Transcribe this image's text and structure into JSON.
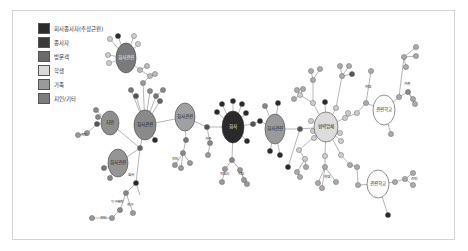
{
  "legend": [
    {
      "label": "회사종사자(추정근원)",
      "color": "#2b2b2b"
    },
    {
      "label": "종사자",
      "color": "#3a3a3a"
    },
    {
      "label": "방문객",
      "color": "#6b6b6b"
    },
    {
      "label": "학생",
      "color": "#d9d9d9"
    },
    {
      "label": "가족",
      "color": "#9a9a9a"
    },
    {
      "label": "지인/기타",
      "color": "#7d7d7d"
    }
  ],
  "hubs": [
    {
      "id": "h1",
      "label": "회사관련",
      "x": 126,
      "y": 58,
      "rx": 10,
      "ry": 15,
      "fill": "#7a7a7a",
      "light": true
    },
    {
      "id": "h2",
      "label": "지인",
      "x": 110,
      "y": 123,
      "rx": 9,
      "ry": 12,
      "fill": "#8f8f8f",
      "light": false
    },
    {
      "id": "h3",
      "label": "회사관련",
      "x": 145,
      "y": 125,
      "rx": 11,
      "ry": 15,
      "fill": "#8a8a8a",
      "light": false
    },
    {
      "id": "h4",
      "label": "회사관련",
      "x": 118,
      "y": 163,
      "rx": 10,
      "ry": 14,
      "fill": "#959595",
      "light": false
    },
    {
      "id": "h5",
      "label": "회사관련",
      "x": 185,
      "y": 117,
      "rx": 10,
      "ry": 14,
      "fill": "#a0a0a0",
      "light": false
    },
    {
      "id": "h6",
      "label": "회사",
      "x": 233,
      "y": 127,
      "rx": 11,
      "ry": 16,
      "fill": "#2a2a2a",
      "light": true
    },
    {
      "id": "h7",
      "label": "회사관련",
      "x": 275,
      "y": 129,
      "rx": 10,
      "ry": 15,
      "fill": "#9a9a9a",
      "light": false
    },
    {
      "id": "h8",
      "label": "협력업체",
      "x": 326,
      "y": 127,
      "rx": 12,
      "ry": 15,
      "fill": "#dcdcdc",
      "light": false
    },
    {
      "id": "h9",
      "label": "관련학교",
      "x": 384,
      "y": 110,
      "rx": 11,
      "ry": 15,
      "fill": "#ffffff",
      "light": false
    },
    {
      "id": "h10",
      "label": "관련학교",
      "x": 378,
      "y": 184,
      "rx": 11,
      "ry": 14,
      "fill": "#ffffff",
      "light": false
    }
  ],
  "edge_labels": [
    {
      "text": "지인",
      "x": 84,
      "y": 136
    },
    {
      "text": "회사",
      "x": 131,
      "y": 176
    },
    {
      "text": "누구관련",
      "x": 117,
      "y": 203
    },
    {
      "text": "친구",
      "x": 130,
      "y": 206
    },
    {
      "text": "지인",
      "x": 103,
      "y": 219
    },
    {
      "text": "지인",
      "x": 175,
      "y": 160
    },
    {
      "text": "가족",
      "x": 208,
      "y": 140
    },
    {
      "text": "학원시",
      "x": 224,
      "y": 175
    },
    {
      "text": "지인",
      "x": 241,
      "y": 175
    },
    {
      "text": "학원",
      "x": 368,
      "y": 88
    },
    {
      "text": "가족",
      "x": 407,
      "y": 85
    },
    {
      "text": "학원",
      "x": 327,
      "y": 178
    },
    {
      "text": "지인",
      "x": 414,
      "y": 180
    }
  ],
  "small_nodes": [
    {
      "x": 118,
      "y": 36,
      "c": "#2a2a2a"
    },
    {
      "x": 110,
      "y": 39,
      "c": "#ccc"
    },
    {
      "x": 134,
      "y": 36,
      "c": "#ccc"
    },
    {
      "x": 138,
      "y": 44,
      "c": "#ccc"
    },
    {
      "x": 108,
      "y": 55,
      "c": "#ccc"
    },
    {
      "x": 109,
      "y": 63,
      "c": "#ccc"
    },
    {
      "x": 140,
      "y": 70,
      "c": "#bbb"
    },
    {
      "x": 147,
      "y": 66,
      "c": "#bbb"
    },
    {
      "x": 150,
      "y": 76,
      "c": "#bbb"
    },
    {
      "x": 155,
      "y": 74,
      "c": "#bbb"
    },
    {
      "x": 143,
      "y": 83,
      "c": "#999"
    },
    {
      "x": 131,
      "y": 90,
      "c": "#777"
    },
    {
      "x": 136,
      "y": 96,
      "c": "#555"
    },
    {
      "x": 150,
      "y": 91,
      "c": "#888"
    },
    {
      "x": 156,
      "y": 96,
      "c": "#777"
    },
    {
      "x": 160,
      "y": 101,
      "c": "#666"
    },
    {
      "x": 163,
      "y": 90,
      "c": "#888"
    },
    {
      "x": 96,
      "y": 110,
      "c": "#888"
    },
    {
      "x": 98,
      "y": 117,
      "c": "#888"
    },
    {
      "x": 97,
      "y": 124,
      "c": "#555"
    },
    {
      "x": 87,
      "y": 133,
      "c": "#999"
    },
    {
      "x": 78,
      "y": 135,
      "c": "#999"
    },
    {
      "x": 155,
      "y": 140,
      "c": "#2a2a2a"
    },
    {
      "x": 140,
      "y": 148,
      "c": "#666"
    },
    {
      "x": 104,
      "y": 168,
      "c": "#777"
    },
    {
      "x": 110,
      "y": 178,
      "c": "#888"
    },
    {
      "x": 136,
      "y": 183,
      "c": "#2a2a2a"
    },
    {
      "x": 126,
      "y": 193,
      "c": "#888"
    },
    {
      "x": 120,
      "y": 210,
      "c": "#888"
    },
    {
      "x": 133,
      "y": 213,
      "c": "#999"
    },
    {
      "x": 92,
      "y": 218,
      "c": "#999"
    },
    {
      "x": 112,
      "y": 218,
      "c": "#999"
    },
    {
      "x": 186,
      "y": 140,
      "c": "#777"
    },
    {
      "x": 183,
      "y": 153,
      "c": "#888"
    },
    {
      "x": 175,
      "y": 165,
      "c": "#999"
    },
    {
      "x": 181,
      "y": 168,
      "c": "#999"
    },
    {
      "x": 190,
      "y": 163,
      "c": "#999"
    },
    {
      "x": 207,
      "y": 127,
      "c": "#555"
    },
    {
      "x": 210,
      "y": 143,
      "c": "#888"
    },
    {
      "x": 208,
      "y": 155,
      "c": "#999"
    },
    {
      "x": 217,
      "y": 112,
      "c": "#2a2a2a"
    },
    {
      "x": 222,
      "y": 104,
      "c": "#2a2a2a"
    },
    {
      "x": 233,
      "y": 101,
      "c": "#2a2a2a"
    },
    {
      "x": 242,
      "y": 104,
      "c": "#2a2a2a"
    },
    {
      "x": 246,
      "y": 113,
      "c": "#2a2a2a"
    },
    {
      "x": 247,
      "y": 141,
      "c": "#2a2a2a"
    },
    {
      "x": 253,
      "y": 124,
      "c": "#555"
    },
    {
      "x": 260,
      "y": 121,
      "c": "#2a2a2a"
    },
    {
      "x": 232,
      "y": 160,
      "c": "#888"
    },
    {
      "x": 225,
      "y": 169,
      "c": "#999"
    },
    {
      "x": 240,
      "y": 170,
      "c": "#999"
    },
    {
      "x": 222,
      "y": 182,
      "c": "#999"
    },
    {
      "x": 244,
      "y": 180,
      "c": "#999"
    },
    {
      "x": 247,
      "y": 184,
      "c": "#999"
    },
    {
      "x": 265,
      "y": 106,
      "c": "#888"
    },
    {
      "x": 278,
      "y": 103,
      "c": "#2a2a2a"
    },
    {
      "x": 270,
      "y": 151,
      "c": "#2a2a2a"
    },
    {
      "x": 280,
      "y": 155,
      "c": "#2a2a2a"
    },
    {
      "x": 300,
      "y": 129,
      "c": "#555"
    },
    {
      "x": 288,
      "y": 167,
      "c": "#2a2a2a"
    },
    {
      "x": 313,
      "y": 103,
      "c": "#ccc"
    },
    {
      "x": 325,
      "y": 102,
      "c": "#2a2a2a"
    },
    {
      "x": 336,
      "y": 108,
      "c": "#ccc"
    },
    {
      "x": 345,
      "y": 118,
      "c": "#ccc"
    },
    {
      "x": 348,
      "y": 113,
      "c": "#ccc"
    },
    {
      "x": 311,
      "y": 121,
      "c": "#ccc"
    },
    {
      "x": 313,
      "y": 131,
      "c": "#ccc"
    },
    {
      "x": 314,
      "y": 138,
      "c": "#ccc"
    },
    {
      "x": 340,
      "y": 133,
      "c": "#ccc"
    },
    {
      "x": 341,
      "y": 141,
      "c": "#ccc"
    },
    {
      "x": 300,
      "y": 95,
      "c": "#ccc"
    },
    {
      "x": 294,
      "y": 99,
      "c": "#aaa"
    },
    {
      "x": 297,
      "y": 90,
      "c": "#aaa"
    },
    {
      "x": 303,
      "y": 89,
      "c": "#aaa"
    },
    {
      "x": 313,
      "y": 80,
      "c": "#aaa"
    },
    {
      "x": 311,
      "y": 71,
      "c": "#aaa"
    },
    {
      "x": 320,
      "y": 69,
      "c": "#aaa"
    },
    {
      "x": 342,
      "y": 76,
      "c": "#aaa"
    },
    {
      "x": 340,
      "y": 66,
      "c": "#aaa"
    },
    {
      "x": 349,
      "y": 66,
      "c": "#aaa"
    },
    {
      "x": 352,
      "y": 74,
      "c": "#555"
    },
    {
      "x": 357,
      "y": 113,
      "c": "#ccc"
    },
    {
      "x": 366,
      "y": 103,
      "c": "#aaa"
    },
    {
      "x": 371,
      "y": 71,
      "c": "#aaa"
    },
    {
      "x": 299,
      "y": 150,
      "c": "#ccc"
    },
    {
      "x": 305,
      "y": 159,
      "c": "#ccc"
    },
    {
      "x": 306,
      "y": 167,
      "c": "#aaa"
    },
    {
      "x": 297,
      "y": 172,
      "c": "#aaa"
    },
    {
      "x": 300,
      "y": 177,
      "c": "#aaa"
    },
    {
      "x": 325,
      "y": 156,
      "c": "#ccc"
    },
    {
      "x": 325,
      "y": 167,
      "c": "#aaa"
    },
    {
      "x": 318,
      "y": 183,
      "c": "#aaa"
    },
    {
      "x": 322,
      "y": 188,
      "c": "#aaa"
    },
    {
      "x": 336,
      "y": 182,
      "c": "#aaa"
    },
    {
      "x": 341,
      "y": 155,
      "c": "#ccc"
    },
    {
      "x": 350,
      "y": 165,
      "c": "#aaa"
    },
    {
      "x": 357,
      "y": 167,
      "c": "#aaa"
    },
    {
      "x": 358,
      "y": 185,
      "c": "#aaa"
    },
    {
      "x": 399,
      "y": 97,
      "c": "#aaa"
    },
    {
      "x": 408,
      "y": 92,
      "c": "#888"
    },
    {
      "x": 413,
      "y": 99,
      "c": "#aaa"
    },
    {
      "x": 415,
      "y": 104,
      "c": "#aaa"
    },
    {
      "x": 404,
      "y": 57,
      "c": "#aaa"
    },
    {
      "x": 416,
      "y": 47,
      "c": "#aaa"
    },
    {
      "x": 416,
      "y": 56,
      "c": "#aaa"
    },
    {
      "x": 406,
      "y": 67,
      "c": "#aaa"
    },
    {
      "x": 391,
      "y": 134,
      "c": "#aaa"
    },
    {
      "x": 395,
      "y": 182,
      "c": "#aaa"
    },
    {
      "x": 405,
      "y": 179,
      "c": "#aaa"
    },
    {
      "x": 413,
      "y": 173,
      "c": "#aaa"
    },
    {
      "x": 413,
      "y": 185,
      "c": "#aaa"
    },
    {
      "x": 388,
      "y": 215,
      "c": "#2a2a2a"
    }
  ],
  "edges": [
    [
      126,
      58,
      118,
      36
    ],
    [
      126,
      58,
      110,
      39
    ],
    [
      126,
      58,
      134,
      36
    ],
    [
      126,
      58,
      138,
      44
    ],
    [
      126,
      58,
      108,
      55
    ],
    [
      126,
      58,
      109,
      63
    ],
    [
      126,
      58,
      140,
      70
    ],
    [
      140,
      70,
      147,
      66
    ],
    [
      140,
      70,
      150,
      76
    ],
    [
      150,
      76,
      155,
      74
    ],
    [
      150,
      76,
      143,
      83
    ],
    [
      143,
      83,
      145,
      125
    ],
    [
      131,
      90,
      145,
      125
    ],
    [
      136,
      96,
      145,
      125
    ],
    [
      150,
      91,
      145,
      125
    ],
    [
      156,
      96,
      145,
      125
    ],
    [
      160,
      101,
      145,
      125
    ],
    [
      163,
      90,
      156,
      96
    ],
    [
      110,
      123,
      96,
      110
    ],
    [
      110,
      123,
      98,
      117
    ],
    [
      110,
      123,
      97,
      124
    ],
    [
      97,
      124,
      87,
      133
    ],
    [
      87,
      133,
      78,
      135
    ],
    [
      145,
      125,
      155,
      140
    ],
    [
      145,
      125,
      140,
      148
    ],
    [
      110,
      123,
      140,
      148
    ],
    [
      140,
      148,
      118,
      163
    ],
    [
      140,
      148,
      136,
      183
    ],
    [
      118,
      163,
      104,
      168
    ],
    [
      118,
      163,
      110,
      178
    ],
    [
      136,
      183,
      126,
      193
    ],
    [
      136,
      183,
      140,
      195
    ],
    [
      126,
      193,
      120,
      210
    ],
    [
      126,
      193,
      133,
      213
    ],
    [
      120,
      210,
      112,
      218
    ],
    [
      112,
      218,
      92,
      218
    ],
    [
      145,
      125,
      185,
      117
    ],
    [
      185,
      117,
      186,
      140
    ],
    [
      186,
      140,
      183,
      153
    ],
    [
      183,
      153,
      175,
      165
    ],
    [
      183,
      153,
      181,
      168
    ],
    [
      183,
      153,
      190,
      163
    ],
    [
      185,
      117,
      207,
      127
    ],
    [
      207,
      127,
      233,
      127
    ],
    [
      207,
      127,
      210,
      143
    ],
    [
      210,
      143,
      208,
      155
    ],
    [
      233,
      127,
      217,
      112
    ],
    [
      233,
      127,
      222,
      104
    ],
    [
      233,
      127,
      233,
      101
    ],
    [
      233,
      127,
      242,
      104
    ],
    [
      233,
      127,
      246,
      113
    ],
    [
      233,
      127,
      247,
      141
    ],
    [
      233,
      127,
      253,
      124
    ],
    [
      253,
      124,
      260,
      121
    ],
    [
      260,
      121,
      275,
      129
    ],
    [
      233,
      127,
      232,
      160
    ],
    [
      232,
      160,
      225,
      169
    ],
    [
      232,
      160,
      240,
      170
    ],
    [
      225,
      169,
      222,
      182
    ],
    [
      240,
      170,
      244,
      180
    ],
    [
      240,
      170,
      247,
      184
    ],
    [
      275,
      129,
      265,
      106
    ],
    [
      275,
      129,
      278,
      103
    ],
    [
      275,
      129,
      270,
      151
    ],
    [
      275,
      129,
      280,
      155
    ],
    [
      275,
      129,
      300,
      129
    ],
    [
      300,
      129,
      326,
      127
    ],
    [
      300,
      129,
      288,
      167
    ],
    [
      326,
      127,
      313,
      103
    ],
    [
      326,
      127,
      325,
      102
    ],
    [
      326,
      127,
      336,
      108
    ],
    [
      326,
      127,
      345,
      118
    ],
    [
      345,
      118,
      348,
      113
    ],
    [
      326,
      127,
      311,
      121
    ],
    [
      326,
      127,
      313,
      131
    ],
    [
      326,
      127,
      314,
      138
    ],
    [
      326,
      127,
      340,
      133
    ],
    [
      326,
      127,
      341,
      141
    ],
    [
      313,
      103,
      300,
      95
    ],
    [
      300,
      95,
      294,
      99
    ],
    [
      300,
      95,
      297,
      90
    ],
    [
      300,
      95,
      303,
      89
    ],
    [
      336,
      108,
      342,
      76
    ],
    [
      342,
      76,
      340,
      66
    ],
    [
      342,
      76,
      349,
      66
    ],
    [
      342,
      76,
      352,
      74
    ],
    [
      313,
      103,
      313,
      80
    ],
    [
      313,
      80,
      311,
      71
    ],
    [
      313,
      80,
      320,
      69
    ],
    [
      345,
      118,
      357,
      113
    ],
    [
      357,
      113,
      366,
      103
    ],
    [
      366,
      103,
      371,
      71
    ],
    [
      366,
      103,
      384,
      110
    ],
    [
      326,
      127,
      299,
      150
    ],
    [
      299,
      150,
      305,
      159
    ],
    [
      305,
      159,
      306,
      167
    ],
    [
      305,
      159,
      297,
      172
    ],
    [
      297,
      172,
      300,
      177
    ],
    [
      326,
      127,
      325,
      156
    ],
    [
      325,
      156,
      325,
      167
    ],
    [
      325,
      167,
      318,
      183
    ],
    [
      325,
      167,
      322,
      188
    ],
    [
      325,
      167,
      336,
      182
    ],
    [
      326,
      127,
      341,
      155
    ],
    [
      341,
      155,
      350,
      165
    ],
    [
      350,
      165,
      357,
      167
    ],
    [
      357,
      167,
      358,
      185
    ],
    [
      358,
      185,
      378,
      184
    ],
    [
      384,
      110,
      399,
      97
    ],
    [
      399,
      97,
      408,
      92
    ],
    [
      408,
      92,
      413,
      99
    ],
    [
      408,
      92,
      415,
      104
    ],
    [
      399,
      97,
      404,
      57
    ],
    [
      404,
      57,
      416,
      47
    ],
    [
      404,
      57,
      416,
      56
    ],
    [
      404,
      57,
      406,
      67
    ],
    [
      384,
      110,
      391,
      134
    ],
    [
      378,
      184,
      395,
      182
    ],
    [
      395,
      182,
      405,
      179
    ],
    [
      405,
      179,
      413,
      173
    ],
    [
      405,
      179,
      413,
      185
    ],
    [
      378,
      184,
      388,
      215
    ]
  ]
}
